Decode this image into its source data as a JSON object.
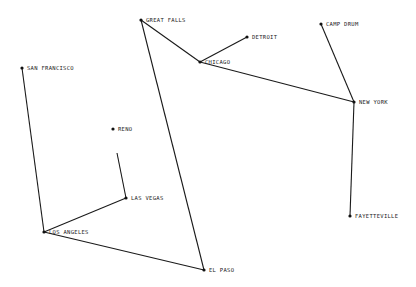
{
  "diagram": {
    "type": "network-map",
    "colors": {
      "background": "#ffffff",
      "line": "#1a1a1a",
      "node": "#111111",
      "text": "#222222"
    },
    "nodes": [
      {
        "id": "great_falls",
        "label": "GREAT FALLS",
        "x": 141,
        "y": 20
      },
      {
        "id": "detroit",
        "label": "DETROIT",
        "x": 247,
        "y": 37
      },
      {
        "id": "chicago",
        "label": "CHICAGO",
        "x": 200,
        "y": 62
      },
      {
        "id": "camp_drum",
        "label": "CAMP DRUM",
        "x": 321,
        "y": 24
      },
      {
        "id": "new_york",
        "label": "NEW YORK",
        "x": 354,
        "y": 102
      },
      {
        "id": "san_francisco",
        "label": "SAN FRANCISCO",
        "x": 22,
        "y": 68
      },
      {
        "id": "reno",
        "label": "RENO",
        "x": 113,
        "y": 129
      },
      {
        "id": "las_vegas",
        "label": "LAS VEGAS",
        "x": 126,
        "y": 198
      },
      {
        "id": "los_angeles",
        "label": "LOS ANGELES",
        "x": 44,
        "y": 232
      },
      {
        "id": "el_paso",
        "label": "EL PASO",
        "x": 204,
        "y": 270
      },
      {
        "id": "fayetteville",
        "label": "FAYETTEVILLE",
        "x": 350,
        "y": 216
      }
    ],
    "edges": [
      {
        "from": "san_francisco",
        "to": "los_angeles"
      },
      {
        "from": "los_angeles",
        "to": "las_vegas"
      },
      {
        "from": "los_angeles",
        "to": "el_paso"
      },
      {
        "from": "el_paso",
        "to": "great_falls"
      },
      {
        "from": "great_falls",
        "to": "chicago"
      },
      {
        "from": "chicago",
        "to": "detroit"
      },
      {
        "from": "chicago",
        "to": "new_york"
      },
      {
        "from": "camp_drum",
        "to": "new_york"
      },
      {
        "from": "new_york",
        "to": "fayetteville"
      }
    ],
    "stub_lines": [
      {
        "from": "las_vegas",
        "to_point": {
          "x": 117,
          "y": 153
        }
      }
    ]
  }
}
